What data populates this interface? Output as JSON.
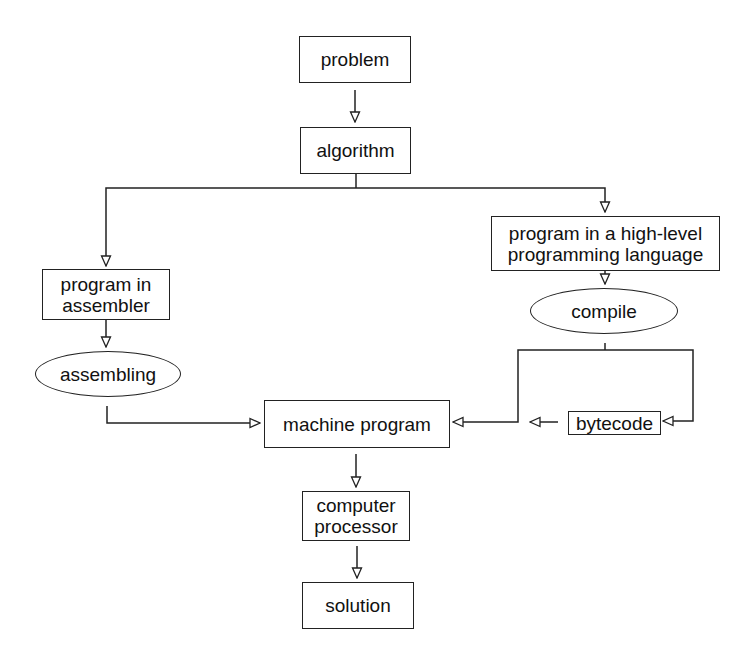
{
  "diagram": {
    "type": "flowchart",
    "nodes": {
      "problem": {
        "label": "problem",
        "shape": "rectangle"
      },
      "algorithm": {
        "label": "algorithm",
        "shape": "rectangle"
      },
      "assembler": {
        "label": "program in\nassembler",
        "shape": "rectangle"
      },
      "assembling": {
        "label": "assembling",
        "shape": "ellipse"
      },
      "highlevel": {
        "label": "program in a high-level\nprogramming language",
        "shape": "rectangle"
      },
      "compile": {
        "label": "compile",
        "shape": "ellipse"
      },
      "machine": {
        "label": "machine program",
        "shape": "rectangle"
      },
      "bytecode": {
        "label": "bytecode",
        "shape": "rectangle"
      },
      "processor": {
        "label": "computer\nprocessor",
        "shape": "rectangle"
      },
      "solution": {
        "label": "solution",
        "shape": "rectangle"
      }
    },
    "edges": [
      {
        "from": "problem",
        "to": "algorithm"
      },
      {
        "from": "algorithm",
        "to": "assembler"
      },
      {
        "from": "algorithm",
        "to": "highlevel"
      },
      {
        "from": "assembler",
        "to": "assembling"
      },
      {
        "from": "assembling",
        "to": "machine"
      },
      {
        "from": "highlevel",
        "to": "compile"
      },
      {
        "from": "compile",
        "to": "machine"
      },
      {
        "from": "compile",
        "to": "bytecode"
      },
      {
        "from": "bytecode",
        "to": "machine"
      },
      {
        "from": "machine",
        "to": "processor"
      },
      {
        "from": "processor",
        "to": "solution"
      }
    ]
  }
}
